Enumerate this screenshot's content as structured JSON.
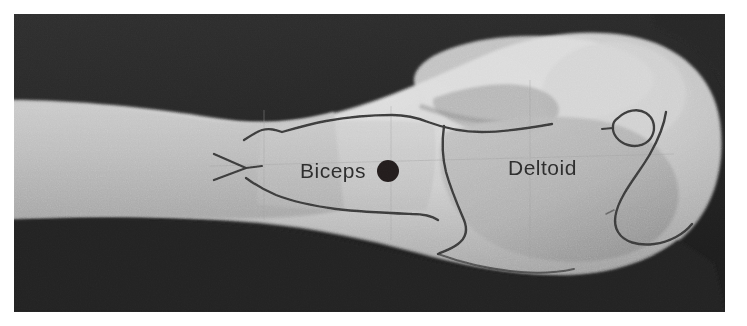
{
  "figure": {
    "type": "photograph",
    "background_color": "#262626",
    "page_background_color": "#ffffff",
    "plate": {
      "x": 14,
      "y": 14,
      "width": 711,
      "height": 298
    }
  },
  "labels": [
    {
      "id": "biceps",
      "text": "Biceps",
      "x": 300,
      "y": 178,
      "color": "#2b2b2b"
    },
    {
      "id": "deltoid",
      "text": "Deltoid",
      "x": 508,
      "y": 175,
      "color": "#2b2b2b"
    }
  ],
  "markers": [
    {
      "id": "injection-site-dot",
      "shape": "filled-circle",
      "x": 388,
      "y": 171,
      "radius": 11,
      "color": "#241f1f"
    }
  ],
  "ink_drawings": [
    {
      "id": "biceps-outline",
      "label": "Biceps muscle border outlined on skin"
    },
    {
      "id": "biceps-distal-tendon-arrow",
      "label": "V-shaped distal tendon mark"
    },
    {
      "id": "deltoid-outline",
      "label": "Deltoid muscle border outlined on skin"
    },
    {
      "id": "acromion-landmark",
      "label": "Small closed blob marking the acromion"
    },
    {
      "id": "deltoid-posterior-hook",
      "label": "Curved hook line on posterior shoulder"
    }
  ],
  "skin_tones": {
    "forearm": "#b8b8b8",
    "upper_arm": "#c2c2c2",
    "deltoid_shadow": "#a8a8a8",
    "shoulder_highlight": "#d9d9d9",
    "ink_line": "#3a3a3a"
  }
}
